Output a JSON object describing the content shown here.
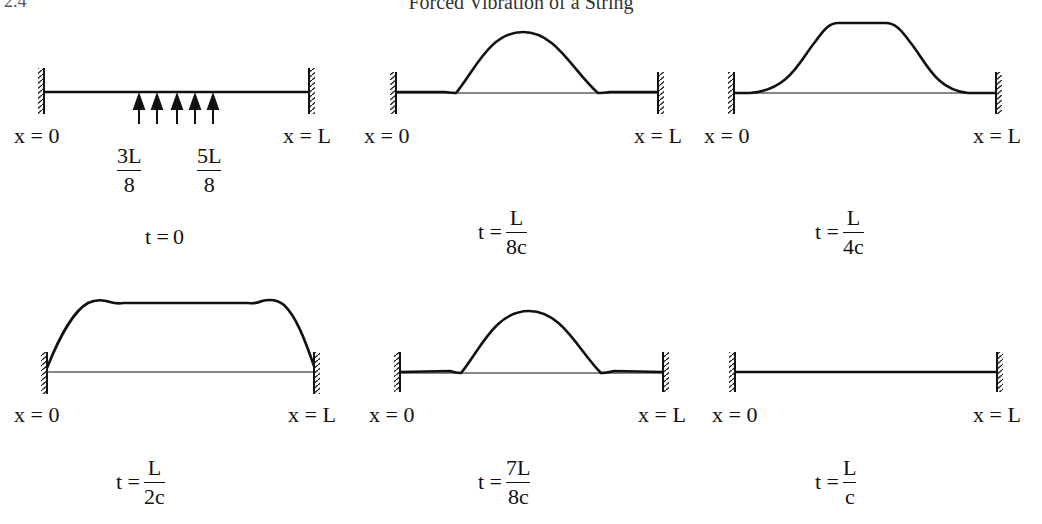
{
  "page": {
    "title": "Forced Vibration of a String",
    "corner_text": "2.4"
  },
  "panels": [
    {
      "id": "t0",
      "time_label": {
        "lhs": "t =",
        "value": "0"
      },
      "left_end": "x = 0",
      "right_end": "x = L",
      "shape": "flat string with upward impulse arrows between 3L/8 and 5L/8",
      "impulse_region": {
        "start": {
          "num": "3L",
          "den": "8"
        },
        "end": {
          "num": "5L",
          "den": "8"
        },
        "arrow_count": 5
      }
    },
    {
      "id": "t_L_8c",
      "time_label": {
        "lhs": "t =",
        "num": "L",
        "den": "8c"
      },
      "left_end": "x = 0",
      "right_end": "x = L",
      "shape": "single bell-shaped pulse centered"
    },
    {
      "id": "t_L_4c",
      "time_label": {
        "lhs": "t =",
        "num": "L",
        "den": "4c"
      },
      "left_end": "x = 0",
      "right_end": "x = L",
      "shape": "wide plateau pulse"
    },
    {
      "id": "t_L_2c",
      "time_label": {
        "lhs": "t =",
        "num": "L",
        "den": "2c"
      },
      "left_end": "x = 0",
      "right_end": "x = L",
      "shape": "plateau spanning whole string, reaching the ends"
    },
    {
      "id": "t_7L_8c",
      "time_label": {
        "lhs": "t =",
        "num": "7L",
        "den": "8c"
      },
      "left_end": "x = 0",
      "right_end": "x = L",
      "shape": "single bell-shaped pulse centered"
    },
    {
      "id": "t_L_c",
      "time_label": {
        "lhs": "t =",
        "num": "L",
        "den": "c"
      },
      "left_end": "x = 0",
      "right_end": "x = L",
      "shape": "flat string"
    }
  ],
  "colors": {
    "ink": "#111111",
    "background": "#ffffff"
  }
}
